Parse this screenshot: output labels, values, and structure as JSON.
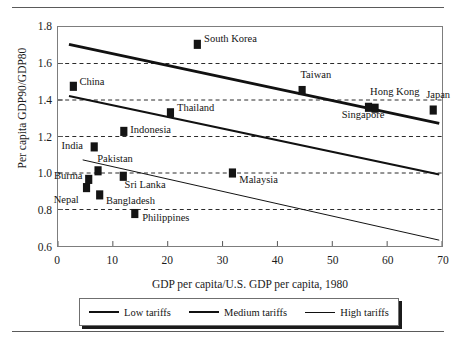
{
  "figure": {
    "x_axis_title": "GDP per capita/U.S. GDP per capita, 1980",
    "y_axis_title": "Per capita GDP90/GDP80"
  },
  "legend": {
    "items": [
      {
        "label": "Low tariffs",
        "style": "thick",
        "color": "#111111"
      },
      {
        "label": "Medium tariffs",
        "style": "medium",
        "color": "#111111"
      },
      {
        "label": "High tariffs",
        "style": "thin",
        "color": "#111111"
      }
    ]
  },
  "chart_data": {
    "type": "scatter",
    "title": "",
    "xlabel": "GDP per capita/U.S. GDP per capita, 1980",
    "ylabel": "Per capita GDP90/GDP80",
    "xlim": [
      0,
      70
    ],
    "ylim": [
      0.6,
      1.8
    ],
    "xticks": [
      0,
      10,
      20,
      30,
      40,
      50,
      60,
      70
    ],
    "yticks": [
      0.6,
      0.8,
      1.0,
      1.2,
      1.4,
      1.6,
      1.8
    ],
    "xtick_labels": [
      "0",
      "10",
      "20",
      "30",
      "40",
      "50",
      "60",
      "70"
    ],
    "ytick_labels": [
      "0.6",
      "0.8",
      "1.0",
      "1.2",
      "1.4",
      "1.6",
      "1.8"
    ],
    "grid": "horizontal dashed gridlines at 0.8, 1.0, 1.2, 1.4, 1.6",
    "gridlines": [
      0.8,
      1.0,
      1.2,
      1.4,
      1.6
    ],
    "legend_position": "below axis, outside plot",
    "marker": "filled black square",
    "points": [
      {
        "name": "China",
        "x": 2.8,
        "y": 1.475,
        "label_dx": 7,
        "label_dy": -5
      },
      {
        "name": "South Korea",
        "x": 25.4,
        "y": 1.705,
        "label_dx": 7,
        "label_dy": -5
      },
      {
        "name": "Taiwan",
        "x": 44.5,
        "y": 1.452,
        "label_dx": -2,
        "label_dy": -16
      },
      {
        "name": "Hong Kong",
        "x": 56.6,
        "y": 1.36,
        "label_dx": 1,
        "label_dy": -16
      },
      {
        "name": "Singapore",
        "x": 57.8,
        "y": 1.355,
        "label_dx": -34,
        "label_dy": 6
      },
      {
        "name": "Japan",
        "x": 68.4,
        "y": 1.345,
        "label_dx": -8,
        "label_dy": -16
      },
      {
        "name": "Thailand",
        "x": 20.5,
        "y": 1.33,
        "label_dx": 7,
        "label_dy": -6
      },
      {
        "name": "Indonesia",
        "x": 12.0,
        "y": 1.228,
        "label_dx": 7,
        "label_dy": -2
      },
      {
        "name": "India",
        "x": 6.6,
        "y": 1.143,
        "label_dx": -32,
        "label_dy": -2
      },
      {
        "name": "Pakistan",
        "x": 7.3,
        "y": 1.012,
        "label_dx": 0,
        "label_dy": -13
      },
      {
        "name": "Burma",
        "x": 5.6,
        "y": 0.965,
        "label_dx": -34,
        "label_dy": -5
      },
      {
        "name": "Sri Lanka",
        "x": 11.9,
        "y": 0.982,
        "label_dx": 2,
        "label_dy": 7
      },
      {
        "name": "Nepal",
        "x": 5.2,
        "y": 0.92,
        "label_dx": -32,
        "label_dy": 11
      },
      {
        "name": "Bangladesh",
        "x": 7.6,
        "y": 0.88,
        "label_dx": 7,
        "label_dy": 5
      },
      {
        "name": "Philippines",
        "x": 14.0,
        "y": 0.778,
        "label_dx": 8,
        "label_dy": 3
      },
      {
        "name": "Malaysia",
        "x": 31.8,
        "y": 1.0,
        "label_dx": 7,
        "label_dy": 6
      }
    ],
    "series": [
      {
        "name": "Low tariffs",
        "type": "trendline",
        "style": "thick",
        "x": [
          2.0,
          69.5
        ],
        "y": [
          1.705,
          1.272
        ]
      },
      {
        "name": "Medium tariffs",
        "type": "trendline",
        "style": "medium",
        "x": [
          2.0,
          69.5
        ],
        "y": [
          1.422,
          0.992
        ]
      },
      {
        "name": "High tariffs",
        "type": "trendline",
        "style": "thin",
        "x": [
          4.5,
          69.5
        ],
        "y": [
          1.072,
          0.632
        ]
      }
    ]
  }
}
